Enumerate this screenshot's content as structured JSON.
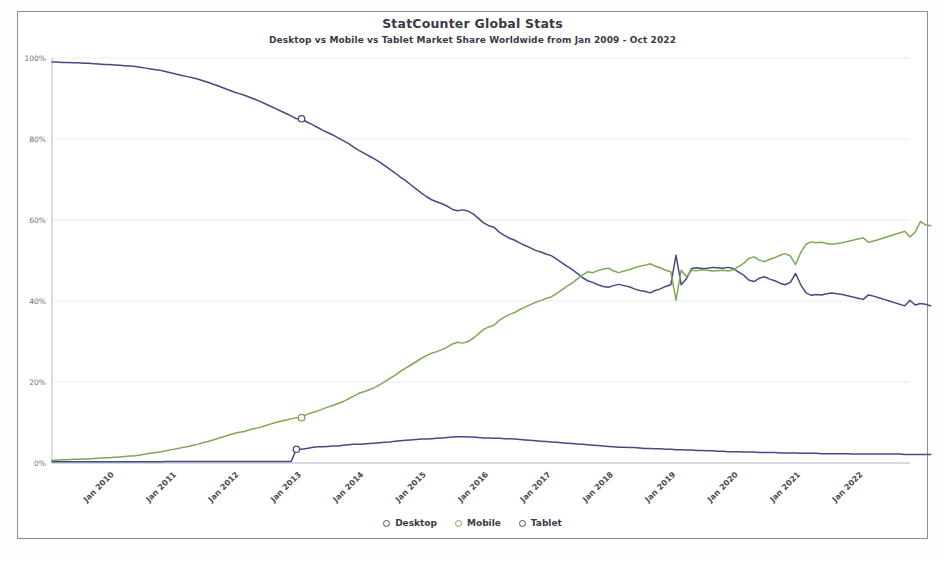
{
  "chart_data": {
    "type": "line",
    "title": "StatCounter Global Stats",
    "subtitle": "Desktop vs Mobile vs Tablet Market Share Worldwide from Jan 2009 - Oct 2022",
    "xlabel": "",
    "ylabel": "",
    "ylim": [
      0,
      100
    ],
    "yticks": [
      0,
      20,
      40,
      60,
      80,
      100
    ],
    "ytick_labels": [
      "0%",
      "20%",
      "40%",
      "60%",
      "80%",
      "100%"
    ],
    "grid": true,
    "legend_position": "bottom",
    "x_range": [
      "Jan 2009",
      "Oct 2022"
    ],
    "xtick_labels": [
      "Jan 2010",
      "Jan 2011",
      "Jan 2012",
      "Jan 2013",
      "Jan 2014",
      "Jan 2015",
      "Jan 2016",
      "Jan 2017",
      "Jan 2018",
      "Jan 2019",
      "Jan 2020",
      "Jan 2021",
      "Jan 2022"
    ],
    "xtick_index": [
      12,
      24,
      36,
      48,
      60,
      72,
      84,
      96,
      108,
      120,
      132,
      144,
      156
    ],
    "n_points": 166,
    "colors": {
      "Desktop": "#454b82",
      "Mobile": "#7fa855",
      "Tablet": "#454b82"
    },
    "series": [
      {
        "name": "Desktop",
        "color": "#454b82",
        "values": [
          99.0,
          99.0,
          98.9,
          98.9,
          98.8,
          98.8,
          98.7,
          98.7,
          98.6,
          98.5,
          98.4,
          98.4,
          98.3,
          98.2,
          98.1,
          98.0,
          97.9,
          97.7,
          97.5,
          97.3,
          97.1,
          96.9,
          96.6,
          96.3,
          96.0,
          95.7,
          95.4,
          95.1,
          94.8,
          94.4,
          94.0,
          93.5,
          93.1,
          92.6,
          92.1,
          91.6,
          91.2,
          90.8,
          90.3,
          89.8,
          89.3,
          88.7,
          88.1,
          87.5,
          86.9,
          86.3,
          85.7,
          85.0,
          85.0,
          84.2,
          83.6,
          82.9,
          82.2,
          81.6,
          81.0,
          80.3,
          79.6,
          78.9,
          78.0,
          77.2,
          76.5,
          75.8,
          75.1,
          74.3,
          73.4,
          72.5,
          71.6,
          70.6,
          69.7,
          68.7,
          67.7,
          66.7,
          65.8,
          65.0,
          64.5,
          64.0,
          63.4,
          62.6,
          62.3,
          62.5,
          62.2,
          61.5,
          60.4,
          59.3,
          58.6,
          58.2,
          57.0,
          56.2,
          55.5,
          55.0,
          54.3,
          53.7,
          53.1,
          52.5,
          52.1,
          51.6,
          51.2,
          50.4,
          49.5,
          48.6,
          47.8,
          46.8,
          45.8,
          45.0,
          44.6,
          44.0,
          43.6,
          43.4,
          43.8,
          44.1,
          43.8,
          43.5,
          43.0,
          42.6,
          42.4,
          42.0,
          42.6,
          43.0,
          43.6,
          44.0,
          51.3,
          44.0,
          45.5,
          48.0,
          48.2,
          48.0,
          48.1,
          48.3,
          48.2,
          48.1,
          48.3,
          48.0,
          47.2,
          46.4,
          45.2,
          44.8,
          45.6,
          46.0,
          45.4,
          45.0,
          44.4,
          44.0,
          44.6,
          46.8,
          44.0,
          42.0,
          41.4,
          41.6,
          41.5,
          41.8,
          42.0,
          41.8,
          41.6,
          41.3,
          41.0,
          40.7,
          40.4,
          41.5,
          41.2,
          40.8,
          40.4,
          40.0,
          39.6,
          39.2,
          38.8,
          40.2,
          39.0,
          39.4,
          39.2,
          38.8
        ]
      },
      {
        "name": "Mobile",
        "color": "#7fa855",
        "values": [
          0.7,
          0.7,
          0.8,
          0.8,
          0.9,
          0.9,
          1.0,
          1.0,
          1.1,
          1.2,
          1.3,
          1.3,
          1.4,
          1.5,
          1.6,
          1.7,
          1.8,
          2.0,
          2.2,
          2.4,
          2.6,
          2.8,
          3.0,
          3.3,
          3.5,
          3.8,
          4.0,
          4.3,
          4.6,
          5.0,
          5.3,
          5.7,
          6.1,
          6.5,
          6.9,
          7.3,
          7.6,
          7.8,
          8.2,
          8.5,
          8.8,
          9.2,
          9.6,
          10.0,
          10.3,
          10.6,
          10.9,
          11.2,
          11.2,
          12.0,
          12.4,
          12.8,
          13.3,
          13.8,
          14.2,
          14.7,
          15.2,
          15.8,
          16.5,
          17.2,
          17.6,
          18.1,
          18.6,
          19.3,
          20.1,
          20.9,
          21.7,
          22.6,
          23.4,
          24.2,
          25.0,
          25.8,
          26.5,
          27.1,
          27.5,
          28.0,
          28.6,
          29.4,
          29.8,
          29.6,
          30.0,
          30.8,
          31.9,
          33.0,
          33.6,
          34.0,
          35.2,
          36.0,
          36.7,
          37.2,
          37.9,
          38.5,
          39.1,
          39.7,
          40.1,
          40.6,
          41.0,
          41.8,
          42.7,
          43.6,
          44.4,
          45.4,
          46.4,
          47.2,
          47.0,
          47.5,
          47.9,
          48.1,
          47.4,
          47.0,
          47.4,
          47.7,
          48.2,
          48.6,
          48.8,
          49.2,
          48.6,
          48.2,
          47.6,
          47.2,
          40.2,
          47.6,
          46.0,
          47.6,
          47.5,
          47.7,
          47.6,
          47.4,
          47.5,
          47.6,
          47.4,
          47.7,
          48.5,
          49.3,
          50.5,
          50.9,
          50.1,
          49.7,
          50.3,
          50.7,
          51.3,
          51.7,
          51.1,
          49.0,
          52.0,
          54.0,
          54.6,
          54.4,
          54.5,
          54.2,
          54.0,
          54.2,
          54.4,
          54.7,
          55.0,
          55.3,
          55.6,
          54.5,
          54.8,
          55.2,
          55.6,
          56.0,
          56.4,
          56.8,
          57.2,
          55.8,
          57.0,
          59.6,
          58.8,
          58.6
        ]
      },
      {
        "name": "Tablet",
        "color": "#454b82",
        "values": [
          0.3,
          0.3,
          0.3,
          0.3,
          0.3,
          0.3,
          0.3,
          0.3,
          0.3,
          0.3,
          0.3,
          0.3,
          0.3,
          0.3,
          0.3,
          0.3,
          0.3,
          0.3,
          0.3,
          0.3,
          0.3,
          0.3,
          0.4,
          0.4,
          0.4,
          0.4,
          0.4,
          0.4,
          0.4,
          0.4,
          0.4,
          0.4,
          0.4,
          0.4,
          0.4,
          0.4,
          0.4,
          0.4,
          0.4,
          0.4,
          0.4,
          0.4,
          0.4,
          0.4,
          0.4,
          0.4,
          0.4,
          3.4,
          3.4,
          3.6,
          3.8,
          4.0,
          4.0,
          4.1,
          4.2,
          4.2,
          4.4,
          4.5,
          4.6,
          4.6,
          4.7,
          4.8,
          4.9,
          5.0,
          5.1,
          5.2,
          5.4,
          5.5,
          5.6,
          5.7,
          5.8,
          5.9,
          5.9,
          6.0,
          6.1,
          6.2,
          6.3,
          6.4,
          6.5,
          6.5,
          6.4,
          6.4,
          6.3,
          6.2,
          6.2,
          6.1,
          6.1,
          6.0,
          6.0,
          5.9,
          5.8,
          5.7,
          5.6,
          5.5,
          5.4,
          5.3,
          5.2,
          5.1,
          5.0,
          4.9,
          4.8,
          4.7,
          4.6,
          4.5,
          4.4,
          4.3,
          4.2,
          4.1,
          4.0,
          3.9,
          3.9,
          3.8,
          3.8,
          3.7,
          3.6,
          3.6,
          3.5,
          3.5,
          3.4,
          3.4,
          3.3,
          3.3,
          3.2,
          3.2,
          3.1,
          3.1,
          3.0,
          3.0,
          2.9,
          2.9,
          2.8,
          2.8,
          2.8,
          2.7,
          2.7,
          2.7,
          2.6,
          2.6,
          2.6,
          2.6,
          2.5,
          2.5,
          2.5,
          2.5,
          2.4,
          2.4,
          2.4,
          2.4,
          2.3,
          2.3,
          2.3,
          2.3,
          2.3,
          2.3,
          2.2,
          2.2,
          2.2,
          2.2,
          2.2,
          2.2,
          2.2,
          2.2,
          2.2,
          2.2,
          2.1,
          2.1,
          2.1,
          2.1,
          2.1,
          2.1
        ]
      }
    ],
    "markers": [
      {
        "series": "Desktop",
        "index": 48,
        "value": 85.0
      },
      {
        "series": "Mobile",
        "index": 48,
        "value": 11.2
      },
      {
        "series": "Tablet",
        "index": 47,
        "value": 3.4
      }
    ]
  },
  "legend": {
    "items": [
      {
        "label": "Desktop",
        "color": "#454b82"
      },
      {
        "label": "Mobile",
        "color": "#7fa855"
      },
      {
        "label": "Tablet",
        "color": "#454b82"
      }
    ]
  }
}
